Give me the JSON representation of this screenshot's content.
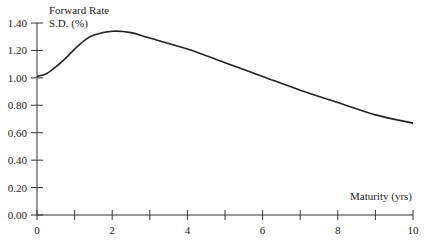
{
  "chart_data": {
    "type": "line",
    "title": "",
    "ylabel": "Forward Rate S.D. (%)",
    "ylabel_lines": [
      "Forward Rate",
      "S.D. (%)"
    ],
    "xlabel": "Maturity (yrs)",
    "xlim": [
      0,
      10
    ],
    "ylim": [
      0,
      1.4
    ],
    "x_ticks": [
      0,
      1,
      2,
      3,
      4,
      5,
      6,
      7,
      8,
      9,
      10
    ],
    "x_tick_labels": [
      "0",
      "",
      "2",
      "",
      "4",
      "",
      "6",
      "",
      "8",
      "",
      "10"
    ],
    "y_ticks": [
      0,
      0.2,
      0.4,
      0.6,
      0.8,
      1.0,
      1.2,
      1.4
    ],
    "y_tick_labels": [
      "0.00",
      "0.20",
      "0.40",
      "0.60",
      "0.80",
      "1.00",
      "1.20",
      "1.40"
    ],
    "grid": false,
    "legend": null,
    "series": [
      {
        "name": "Forward Rate S.D.",
        "color": "#222222",
        "x": [
          0,
          0.25,
          0.5,
          0.75,
          1.0,
          1.25,
          1.5,
          2.0,
          2.5,
          3.0,
          4.0,
          5.0,
          6.0,
          7.0,
          8.0,
          9.0,
          10.0
        ],
        "values": [
          1.01,
          1.03,
          1.08,
          1.14,
          1.21,
          1.27,
          1.31,
          1.34,
          1.33,
          1.29,
          1.21,
          1.11,
          1.01,
          0.91,
          0.82,
          0.73,
          0.67
        ]
      }
    ]
  }
}
